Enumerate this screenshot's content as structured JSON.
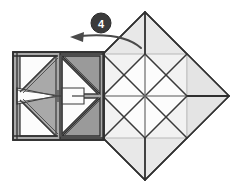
{
  "figure": {
    "kind": "origami-folding-diagram",
    "step_badge": {
      "label": "4",
      "shape": "circle",
      "fill_color": "#3b3b3b",
      "text_color": "#ffffff",
      "center_x": 101,
      "center_y": 23,
      "radius": 10
    },
    "action_arrow": {
      "name": "fold-left-arrow",
      "direction": "right-to-left",
      "description": "curved arrow pointing left indicating fold flap to the left",
      "stroke_color": "#4a4a4a",
      "start_x": 141,
      "start_y": 48,
      "end_x": 74,
      "end_y": 37
    },
    "palette": {
      "paper_light": "#e8e8e8",
      "paper_white": "#fbfbfb",
      "paper_mid": "#a9a9a9",
      "paper_mid_dark": "#9a9a9a",
      "crease_faint": "#c9c9c9",
      "crease_soft": "#8e8e8e",
      "edge_dark": "#2f2f2f",
      "edge_medium": "#555555",
      "background": "#ffffff"
    },
    "right_diamond": {
      "name": "folded-square-diamond",
      "center_x": 145,
      "center_y": 96,
      "half_diagonal": 84,
      "tips": {
        "top": [
          145,
          12
        ],
        "right": [
          229,
          96
        ],
        "bottom": [
          145,
          180
        ],
        "left": [
          61,
          96
        ]
      }
    },
    "left_square": {
      "name": "pinwheel-square",
      "left": 13,
      "top": 52,
      "right": 104,
      "bottom": 140,
      "center_x": 58.5,
      "center_y": 96,
      "pattern": "pinwheel"
    }
  }
}
